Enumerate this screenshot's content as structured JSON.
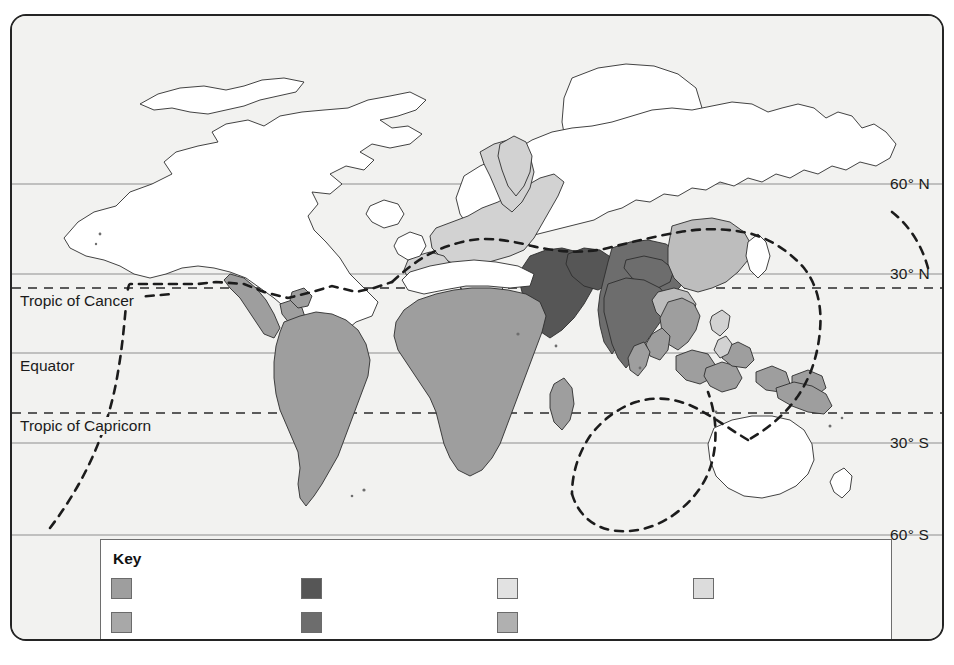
{
  "map": {
    "title": "World map showing shaded regions with latitude reference lines",
    "background_color": "#f2f2f0",
    "frame_color": "#242424",
    "ocean_color": "#f2f2f0",
    "coastline_color": "#2e2e2e",
    "latitude_labels": [
      {
        "id": "lat-60n",
        "text": "60° N",
        "y": 182
      },
      {
        "id": "lat-30n",
        "text": "30° N",
        "y": 272
      },
      {
        "id": "lat-30s",
        "text": "30° S",
        "y": 441
      },
      {
        "id": "lat-60s",
        "text": "60° S",
        "y": 533
      }
    ],
    "line_labels": [
      {
        "id": "tropic-cancer",
        "text": "Tropic of Cancer",
        "y": 286,
        "style": "dashed"
      },
      {
        "id": "equator",
        "text": "Equator",
        "y": 351,
        "style": "solid"
      },
      {
        "id": "tropic-capricorn",
        "text": "Tropic of Capricorn",
        "y": 411,
        "style": "dashed"
      }
    ],
    "boundary_line": {
      "name": "north-south-divide",
      "style": "dashed",
      "color": "#1c1c1c"
    },
    "region_shades": {
      "unshaded": "#ffffff",
      "very_light": "#e6e6e6",
      "light": "#d2d2d2",
      "medium_light": "#bdbdbd",
      "medium": "#9e9e9e",
      "medium_dark": "#8a8a8a",
      "dark": "#6d6d6d",
      "darkest": "#565656"
    }
  },
  "key": {
    "title": "Key",
    "columns": [
      {
        "id": "key-column-1",
        "x": 98,
        "items": [
          {
            "id": "key-item-1a",
            "color": "#9e9e9e",
            "label": ""
          },
          {
            "id": "key-item-1b",
            "color": "#a8a8a8",
            "label": ""
          }
        ]
      },
      {
        "id": "key-column-2",
        "x": 288,
        "items": [
          {
            "id": "key-item-2a",
            "color": "#565656",
            "label": ""
          },
          {
            "id": "key-item-2b",
            "color": "#6d6d6d",
            "label": ""
          }
        ]
      },
      {
        "id": "key-column-3",
        "x": 484,
        "items": [
          {
            "id": "key-item-3a",
            "color": "#e2e2e2",
            "label": ""
          },
          {
            "id": "key-item-3b",
            "color": "#b0b0b0",
            "label": ""
          }
        ]
      },
      {
        "id": "key-column-4",
        "x": 680,
        "items": [
          {
            "id": "key-item-4a",
            "color": "#dcdcdc",
            "label": ""
          }
        ]
      }
    ]
  }
}
